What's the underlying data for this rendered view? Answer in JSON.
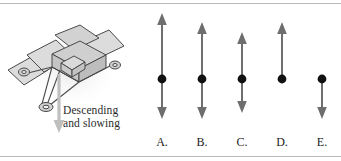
{
  "figure": {
    "illustration": {
      "name": "mars-rover-lander",
      "caption_line1": "Descending",
      "caption_line2": "and slowing",
      "motion_arrow": "down-arrow",
      "panel_fill": "#d9d9d9",
      "outline": "#4a4a4a",
      "shadow": "#e8e8e8"
    },
    "vector_choices": [
      {
        "label": "A.",
        "up_length": 65,
        "down_length": 39,
        "has_up_head": true,
        "has_down_head": true,
        "arrow_color": "#6e6e6e",
        "dot_color": "#111111"
      },
      {
        "label": "B.",
        "up_length": 57,
        "down_length": 39,
        "has_up_head": true,
        "has_down_head": true,
        "arrow_color": "#6e6e6e",
        "dot_color": "#111111"
      },
      {
        "label": "C.",
        "up_length": 47,
        "down_length": 33,
        "has_up_head": true,
        "has_down_head": true,
        "arrow_color": "#6e6e6e",
        "dot_color": "#111111"
      },
      {
        "label": "D.",
        "up_length": 57,
        "down_length": 0,
        "has_up_head": true,
        "has_down_head": false,
        "arrow_color": "#6e6e6e",
        "dot_color": "#111111"
      },
      {
        "label": "E.",
        "up_length": 0,
        "down_length": 39,
        "has_up_head": false,
        "has_down_head": true,
        "arrow_color": "#6e6e6e",
        "dot_color": "#111111"
      }
    ]
  }
}
